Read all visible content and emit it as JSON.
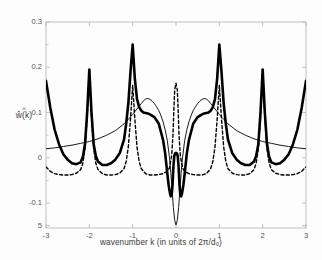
{
  "chart_data": {
    "type": "line",
    "title": "",
    "xlabel": "wavenumber k (in units of 2π/d₀)",
    "ylabel": "ŵ(k)",
    "xlim": [
      -3,
      3
    ],
    "ylim": [
      -0.155,
      0.3
    ],
    "grid": false,
    "legend": "none",
    "xticks": [
      -3,
      -2,
      -1,
      0,
      1,
      2,
      3
    ],
    "xticklabels": [
      "-3",
      "-2",
      "-1",
      "0",
      "1",
      "2",
      "3"
    ],
    "yticks": [
      0.3,
      0.2,
      0.1,
      0.0,
      -0.1,
      -0.15
    ],
    "yticklabels": [
      "0.3",
      "0.2",
      "0.1",
      "0",
      "-0.1",
      "5"
    ],
    "series": [
      {
        "name": "thick-solid",
        "style": "solid",
        "width": 2.6,
        "color": "#000000",
        "description": "sharp resonant peaks at k = ±1 (0.25), ±2 (0.195), edges ±3 (0.17); shoulders near 0.10; W-shaped central well with minima ≈ -0.085 and small central bump ≈ 0.01",
        "x": [
          -3.0,
          -2.9,
          -2.8,
          -2.7,
          -2.6,
          -2.5,
          -2.4,
          -2.3,
          -2.2,
          -2.15,
          -2.1,
          -2.05,
          -2.0,
          -1.95,
          -1.9,
          -1.85,
          -1.8,
          -1.7,
          -1.6,
          -1.5,
          -1.4,
          -1.3,
          -1.2,
          -1.15,
          -1.1,
          -1.05,
          -1.0,
          -0.95,
          -0.9,
          -0.85,
          -0.8,
          -0.75,
          -0.7,
          -0.65,
          -0.6,
          -0.5,
          -0.4,
          -0.3,
          -0.25,
          -0.2,
          -0.17,
          -0.14,
          -0.12,
          -0.1,
          -0.08,
          -0.06,
          -0.04,
          -0.02,
          0.0,
          0.02,
          0.04,
          0.06,
          0.08,
          0.1,
          0.12,
          0.14,
          0.17,
          0.2,
          0.25,
          0.3,
          0.4,
          0.5,
          0.6,
          0.65,
          0.7,
          0.75,
          0.8,
          0.85,
          0.9,
          0.95,
          1.0,
          1.05,
          1.1,
          1.15,
          1.2,
          1.3,
          1.4,
          1.5,
          1.6,
          1.7,
          1.8,
          1.85,
          1.9,
          1.95,
          2.0,
          2.05,
          2.1,
          2.15,
          2.2,
          2.3,
          2.4,
          2.5,
          2.6,
          2.7,
          2.8,
          2.9,
          3.0
        ],
        "y": [
          0.17,
          0.11,
          0.062,
          0.03,
          0.008,
          -0.004,
          -0.012,
          -0.014,
          -0.01,
          0.002,
          0.03,
          0.1,
          0.195,
          0.1,
          0.03,
          0.004,
          -0.008,
          -0.016,
          -0.016,
          -0.012,
          -0.004,
          0.01,
          0.04,
          0.075,
          0.12,
          0.19,
          0.25,
          0.175,
          0.13,
          0.112,
          0.104,
          0.1,
          0.099,
          0.098,
          0.096,
          0.09,
          0.076,
          0.04,
          0.01,
          -0.035,
          -0.06,
          -0.078,
          -0.085,
          -0.082,
          -0.06,
          -0.02,
          0.004,
          0.01,
          0.011,
          0.01,
          0.004,
          -0.02,
          -0.06,
          -0.082,
          -0.085,
          -0.078,
          -0.06,
          -0.035,
          0.01,
          0.04,
          0.076,
          0.09,
          0.096,
          0.098,
          0.099,
          0.1,
          0.104,
          0.112,
          0.13,
          0.175,
          0.25,
          0.19,
          0.12,
          0.075,
          0.04,
          0.01,
          -0.004,
          -0.012,
          -0.016,
          -0.016,
          -0.008,
          0.004,
          0.03,
          0.1,
          0.195,
          0.1,
          0.03,
          0.002,
          -0.01,
          -0.014,
          -0.012,
          -0.004,
          0.008,
          0.03,
          0.062,
          0.11,
          0.17
        ]
      },
      {
        "name": "thin-solid",
        "style": "solid",
        "width": 0.9,
        "color": "#000000",
        "description": "smooth broad envelope rising from ≈ 0.02 at k = ±3 to ≈ 0.13 near k = ±0.7, then plunging to a narrow minimum ≈ -0.145 at k = 0",
        "x": [
          -3.0,
          -2.8,
          -2.6,
          -2.4,
          -2.2,
          -2.0,
          -1.8,
          -1.6,
          -1.4,
          -1.2,
          -1.1,
          -1.0,
          -0.95,
          -0.9,
          -0.85,
          -0.8,
          -0.75,
          -0.7,
          -0.65,
          -0.6,
          -0.55,
          -0.5,
          -0.45,
          -0.4,
          -0.35,
          -0.3,
          -0.25,
          -0.2,
          -0.15,
          -0.12,
          -0.09,
          -0.06,
          -0.03,
          0.0,
          0.03,
          0.06,
          0.09,
          0.12,
          0.15,
          0.2,
          0.25,
          0.3,
          0.35,
          0.4,
          0.45,
          0.5,
          0.55,
          0.6,
          0.65,
          0.7,
          0.75,
          0.8,
          0.85,
          0.9,
          0.95,
          1.0,
          1.1,
          1.2,
          1.4,
          1.6,
          1.8,
          2.0,
          2.2,
          2.4,
          2.6,
          2.8,
          3.0
        ],
        "y": [
          0.02,
          0.022,
          0.025,
          0.028,
          0.032,
          0.036,
          0.042,
          0.05,
          0.06,
          0.075,
          0.085,
          0.096,
          0.102,
          0.108,
          0.114,
          0.12,
          0.126,
          0.13,
          0.131,
          0.129,
          0.125,
          0.12,
          0.113,
          0.105,
          0.094,
          0.08,
          0.062,
          0.038,
          0.0,
          -0.032,
          -0.072,
          -0.11,
          -0.138,
          -0.148,
          -0.138,
          -0.11,
          -0.072,
          -0.032,
          0.0,
          0.038,
          0.062,
          0.08,
          0.094,
          0.105,
          0.113,
          0.12,
          0.125,
          0.129,
          0.131,
          0.13,
          0.126,
          0.12,
          0.114,
          0.108,
          0.102,
          0.096,
          0.085,
          0.075,
          0.06,
          0.05,
          0.042,
          0.036,
          0.032,
          0.028,
          0.025,
          0.022,
          0.02
        ]
      },
      {
        "name": "dashed",
        "style": "dashed",
        "width": 1.4,
        "color": "#000000",
        "description": "narrow symmetric spikes at k = 0 (0.165), ±1 (0.16), ±2 (0.195); flat baseline ≈ -0.035 between spikes",
        "x": [
          -3.0,
          -2.9,
          -2.8,
          -2.7,
          -2.6,
          -2.5,
          -2.4,
          -2.3,
          -2.2,
          -2.15,
          -2.1,
          -2.05,
          -2.0,
          -1.95,
          -1.9,
          -1.85,
          -1.8,
          -1.7,
          -1.6,
          -1.5,
          -1.4,
          -1.3,
          -1.2,
          -1.15,
          -1.1,
          -1.05,
          -1.0,
          -0.95,
          -0.9,
          -0.85,
          -0.8,
          -0.7,
          -0.6,
          -0.5,
          -0.4,
          -0.3,
          -0.2,
          -0.15,
          -0.1,
          -0.07,
          -0.05,
          -0.03,
          0.0,
          0.03,
          0.05,
          0.07,
          0.1,
          0.15,
          0.2,
          0.3,
          0.4,
          0.5,
          0.6,
          0.7,
          0.8,
          0.85,
          0.9,
          0.95,
          1.0,
          1.05,
          1.1,
          1.15,
          1.2,
          1.3,
          1.4,
          1.5,
          1.6,
          1.7,
          1.8,
          1.85,
          1.9,
          1.95,
          2.0,
          2.05,
          2.1,
          2.15,
          2.2,
          2.3,
          2.4,
          2.5,
          2.6,
          2.7,
          2.8,
          2.9,
          3.0
        ],
        "y": [
          -0.02,
          -0.03,
          -0.035,
          -0.037,
          -0.038,
          -0.038,
          -0.037,
          -0.034,
          -0.026,
          -0.012,
          0.02,
          0.09,
          0.195,
          0.09,
          0.02,
          -0.012,
          -0.026,
          -0.035,
          -0.038,
          -0.038,
          -0.037,
          -0.034,
          -0.024,
          -0.008,
          0.024,
          0.086,
          0.16,
          0.086,
          0.024,
          -0.008,
          -0.024,
          -0.035,
          -0.038,
          -0.038,
          -0.037,
          -0.035,
          -0.03,
          -0.022,
          0.005,
          0.05,
          0.105,
          0.15,
          0.165,
          0.15,
          0.105,
          0.05,
          0.005,
          -0.022,
          -0.03,
          -0.035,
          -0.037,
          -0.038,
          -0.038,
          -0.035,
          -0.024,
          -0.008,
          0.024,
          0.086,
          0.16,
          0.086,
          0.024,
          -0.008,
          -0.024,
          -0.034,
          -0.037,
          -0.038,
          -0.038,
          -0.035,
          -0.026,
          -0.012,
          0.02,
          0.09,
          0.195,
          0.09,
          0.02,
          -0.012,
          -0.026,
          -0.034,
          -0.037,
          -0.038,
          -0.038,
          -0.037,
          -0.035,
          -0.03,
          -0.02
        ]
      }
    ],
    "axis_color": "#b9b9b9",
    "tick_color": "#555555",
    "background": "#fdfdfd"
  }
}
